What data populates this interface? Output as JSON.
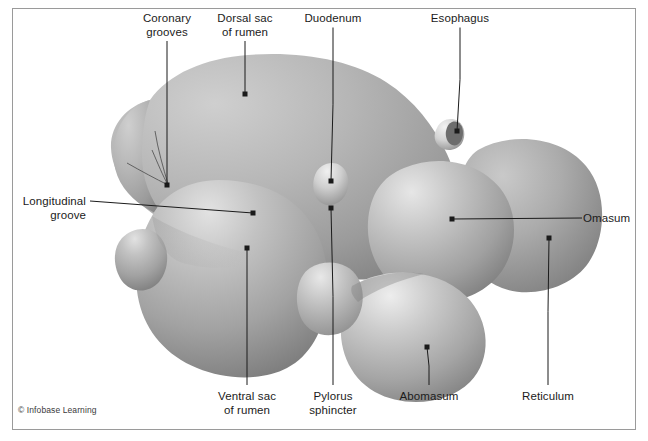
{
  "figure": {
    "background_color": "#ffffff",
    "frame_color": "#9a9a9a",
    "organ_fill_light": "#d9d9d9",
    "organ_fill_mid": "#a8a8a8",
    "organ_fill_dark": "#7d7d7d",
    "leader_line_color": "#1b1b1b",
    "label_color": "#1b1b1b",
    "copyright": "© Infobase Learning"
  },
  "labels": [
    {
      "id": "coronary-grooves",
      "text": "Coronary\ngrooves",
      "anchor": "center",
      "text_x": 167,
      "text_y": 12,
      "dot_x": 167,
      "dot_y": 185
    },
    {
      "id": "dorsal-sac-of-rumen",
      "text": "Dorsal sac\nof rumen",
      "anchor": "center",
      "text_x": 245,
      "text_y": 12,
      "dot_x": 245,
      "dot_y": 94
    },
    {
      "id": "duodenum",
      "text": "Duodenum",
      "anchor": "center",
      "text_x": 333,
      "text_y": 12,
      "dot_x": 331,
      "dot_y": 181
    },
    {
      "id": "esophagus",
      "text": "Esophagus",
      "anchor": "center",
      "text_x": 460,
      "text_y": 12,
      "dot_x": 457,
      "dot_y": 131
    },
    {
      "id": "longitudinal-groove",
      "text": "Longitudinal\ngroove",
      "anchor": "right",
      "text_x": 14,
      "text_y": 195,
      "dot_x": 253,
      "dot_y": 213
    },
    {
      "id": "omasum",
      "text": "Omasum",
      "anchor": "left",
      "text_x": 588,
      "text_y": 212,
      "dot_x": 452,
      "dot_y": 219
    },
    {
      "id": "ventral-sac-of-rumen",
      "text": "Ventral sac\nof rumen",
      "anchor": "center",
      "text_x": 247,
      "text_y": 390,
      "dot_x": 247,
      "dot_y": 248
    },
    {
      "id": "pylorus-sphincter",
      "text": "Pylorus\nsphincter",
      "anchor": "center",
      "text_x": 333,
      "text_y": 390,
      "dot_x": 331,
      "dot_y": 208
    },
    {
      "id": "abomasum",
      "text": "Abomasum",
      "anchor": "center",
      "text_x": 429,
      "text_y": 390,
      "dot_x": 427,
      "dot_y": 347
    },
    {
      "id": "reticulum",
      "text": "Reticulum",
      "anchor": "center",
      "text_x": 548,
      "text_y": 390,
      "dot_x": 549,
      "dot_y": 238
    }
  ]
}
